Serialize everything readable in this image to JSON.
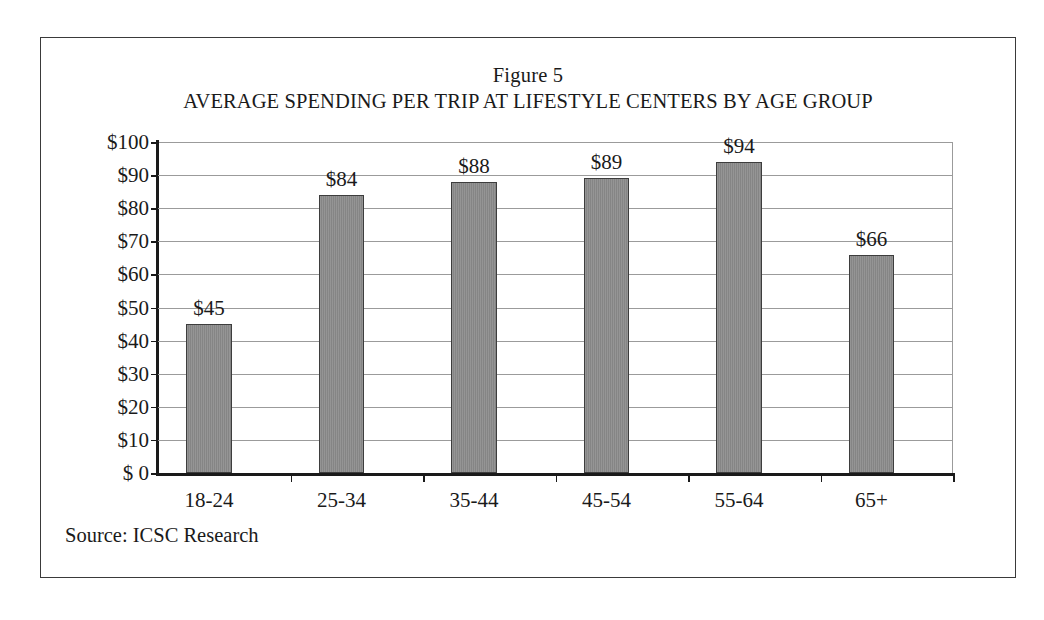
{
  "figure": {
    "number_label": "Figure 5",
    "title": "AVERAGE SPENDING PER TRIP AT LIFESTYLE CENTERS BY AGE GROUP",
    "source_note": "Source: ICSC Research",
    "frame_color": "#3a3a3a",
    "background_color": "#ffffff"
  },
  "chart_data": {
    "type": "bar",
    "title": "AVERAGE SPENDING PER TRIP AT LIFESTYLE CENTERS BY AGE GROUP",
    "subtitle": "Figure 5",
    "xlabel": "",
    "ylabel": "",
    "categories": [
      "18-24",
      "25-34",
      "35-44",
      "45-54",
      "55-64",
      "65+"
    ],
    "values": [
      45,
      84,
      88,
      89,
      94,
      66
    ],
    "data_labels": [
      "$45",
      "$84",
      "$88",
      "$89",
      "$94",
      "$66"
    ],
    "ylim": [
      0,
      100
    ],
    "ytick_values": [
      0,
      10,
      20,
      30,
      40,
      50,
      60,
      70,
      80,
      90,
      100
    ],
    "ytick_labels": [
      "$ 0",
      "$10",
      "$20",
      "$30",
      "$40",
      "$50",
      "$60",
      "$70",
      "$80",
      "$90",
      "$100"
    ],
    "grid": true,
    "grid_axis": "y",
    "legend": false,
    "legend_position": "none",
    "bar_color": "#858585",
    "bar_edge_color": "#3d3d3d",
    "gridline_color": "#9b9b9b",
    "axis_color": "#1a1a1a",
    "annotations": [
      "Source: ICSC Research"
    ]
  }
}
